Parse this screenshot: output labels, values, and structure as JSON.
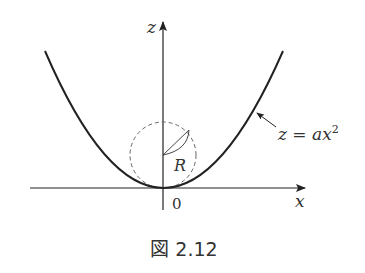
{
  "figure": {
    "caption": "図 2.12",
    "axes": {
      "x_label": "x",
      "z_label": "z",
      "origin_label": "0"
    },
    "curve": {
      "equation_label": "z = ax",
      "equation_lhs": "z = ax",
      "equation_exponent": "2"
    },
    "circle": {
      "radius_label": "R",
      "style": "dashed"
    },
    "colors": {
      "ink": "#222222",
      "dashed": "#666666",
      "background": "#ffffff"
    }
  }
}
